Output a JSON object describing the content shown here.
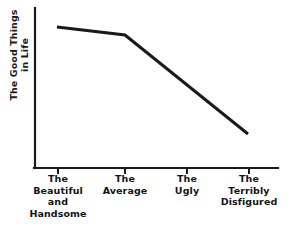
{
  "chart_data": {
    "type": "line",
    "title": "",
    "subtitle": "",
    "xlabel": "",
    "ylabel": "The Good Things in Life",
    "ylabel_lines": [
      "The Good Things",
      "in Life"
    ],
    "categories": [
      "The Beautiful and Handsome",
      "The Average",
      "The Ugly",
      "The Terribly Disfigured"
    ],
    "category_lines": [
      [
        "The",
        "Beautiful",
        "and",
        "Handsome"
      ],
      [
        "The",
        "Average"
      ],
      [
        "The",
        "Ugly"
      ],
      [
        "The",
        "Terribly",
        "Disfigured"
      ]
    ],
    "x": [
      1,
      2,
      3,
      4
    ],
    "values": [
      0.88,
      0.83,
      0.5,
      0.21
    ],
    "series": [
      {
        "name": "The Good Things in Life",
        "values": [
          0.88,
          0.83,
          0.5,
          0.21
        ]
      }
    ],
    "ylim": [
      0,
      1
    ],
    "xlim": [
      0.5,
      4.5
    ],
    "grid": false,
    "legend": false,
    "legend_position": "none",
    "y_tick_labels": [],
    "x_tick_count": 4,
    "annotations": [],
    "line_color": "#1a1a1a",
    "line_width": 3,
    "axis_color": "#1a1a1a",
    "background_color": "#ffffff",
    "text_color": "#141414",
    "note": "Line declines gently from Beautiful-and-Handsome to Average, then drops steeply through Ugly to Terribly Disfigured; no data markers, no numeric tick labels."
  },
  "geometry": {
    "axis": {
      "y_axis_x": 35,
      "y_axis_top": 8,
      "y_axis_bottom": 168,
      "x_axis_y": 168,
      "x_axis_left": 35,
      "x_axis_right": 278,
      "tick_length": 6
    },
    "tick_x": [
      58,
      125,
      187,
      249
    ],
    "line_points": "57,27 125,35 248,134"
  }
}
